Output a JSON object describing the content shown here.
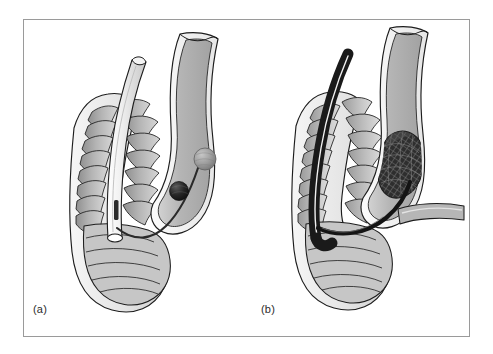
{
  "figure": {
    "kind": "medical-illustration",
    "background_color": "#ffffff",
    "frame": {
      "border_color": "#9a9a9a",
      "fill_color": "#ffffff",
      "x": 23,
      "y": 19,
      "width": 447,
      "height": 318
    },
    "panels": [
      {
        "id": "a",
        "label": "(a)",
        "label_x": 33,
        "label_y": 303,
        "structures": [
          {
            "name": "trachea",
            "note": "anterior airway with cartilage rings, cut-away view",
            "fill_color": "#bcbcbc",
            "outline_color": "#1d1d1d",
            "wall_color": "#e8e8e8"
          },
          {
            "name": "tracheal-tube",
            "note": "light coloured tube inside airway lumen, open bevelled tip",
            "fill_color": "#e4e4e4",
            "outline_color": "#1d1d1d"
          },
          {
            "name": "esophagus",
            "note": "wavy posterior tube to the right of the trachea",
            "fill_color": "#b0b0b0",
            "outline_color": "#1d1d1d",
            "wall_color": "#f0f0f0"
          },
          {
            "name": "guidewire",
            "note": "thin dark curved wire running from tube tip into the esophagus",
            "stroke_color": "#2a2a2a"
          },
          {
            "name": "lesion-sphere-light",
            "note": "upper pale spherical nodule on the wire",
            "fill_color": "#9e9e9e"
          },
          {
            "name": "lesion-sphere-dark",
            "note": "lower dark spherical nodule on the wire",
            "fill_color": "#232323"
          }
        ]
      },
      {
        "id": "b",
        "label": "(b)",
        "label_x": 261,
        "label_y": 303,
        "structures": [
          {
            "name": "trachea",
            "note": "anterior airway with cartilage rings, cut-away view",
            "fill_color": "#bcbcbc",
            "outline_color": "#1d1d1d",
            "wall_color": "#e8e8e8"
          },
          {
            "name": "endoscope-catheter",
            "note": "thick black catheter curving down inside the airway lumen",
            "fill_color": "#1a1a1a",
            "highlight_color": "#f2f2f2"
          },
          {
            "name": "esophagus",
            "note": "wavy posterior tube to the right with a lateral side branch",
            "fill_color": "#b0b0b0",
            "outline_color": "#1d1d1d",
            "wall_color": "#f0f0f0"
          },
          {
            "name": "side-branch",
            "note": "short horizontal branch leaving the lower oesophagus to the right",
            "fill_color": "#b6b6b6",
            "outline_color": "#1d1d1d"
          },
          {
            "name": "mesh-stent",
            "note": "dark cross-hatched braided stent expanded in the oesophageal lumen",
            "fill_color": "#2b2b2b",
            "mesh_color": "#6d6d6d"
          },
          {
            "name": "guidewire",
            "note": "thick black wire crossing from airway into the side branch",
            "stroke_color": "#141414"
          }
        ]
      }
    ]
  }
}
